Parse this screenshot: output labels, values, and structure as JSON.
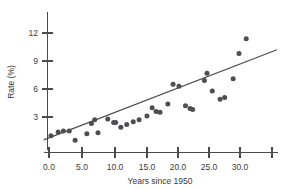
{
  "chart_data": {
    "type": "scatter",
    "title": "",
    "xlabel": "Years since 1950",
    "ylabel": "Rate (%)",
    "xlim": [
      -1.0,
      35.5
    ],
    "ylim": [
      0.0,
      13.0
    ],
    "grid": false,
    "legend": null,
    "x_ticks": [
      0.0,
      5.0,
      10.0,
      15.0,
      20.0,
      25.0,
      30.0,
      35.0
    ],
    "x_tick_labels": [
      "0.0",
      "5.0",
      "10.0",
      "15.0",
      "20.0",
      "25.0",
      "30.0",
      ""
    ],
    "y_ticks": [
      3,
      6,
      9,
      12
    ],
    "y_tick_labels": [
      "3",
      "6",
      "9",
      "12"
    ],
    "point_color": "#4d4d52",
    "line_color": "#4a4a4a",
    "axis_color": "#4a4a4a",
    "points": [
      {
        "x": 0.3,
        "y": 1.0
      },
      {
        "x": 1.4,
        "y": 1.4
      },
      {
        "x": 2.2,
        "y": 1.5
      },
      {
        "x": 3.1,
        "y": 1.5
      },
      {
        "x": 4.0,
        "y": 0.5
      },
      {
        "x": 5.8,
        "y": 1.2
      },
      {
        "x": 6.5,
        "y": 2.3
      },
      {
        "x": 7.0,
        "y": 2.7
      },
      {
        "x": 7.5,
        "y": 1.3
      },
      {
        "x": 9.0,
        "y": 2.8
      },
      {
        "x": 9.9,
        "y": 2.4
      },
      {
        "x": 10.2,
        "y": 2.4
      },
      {
        "x": 11.0,
        "y": 1.9
      },
      {
        "x": 11.9,
        "y": 2.2
      },
      {
        "x": 12.9,
        "y": 2.5
      },
      {
        "x": 13.8,
        "y": 2.7
      },
      {
        "x": 15.0,
        "y": 3.1
      },
      {
        "x": 15.8,
        "y": 4.0
      },
      {
        "x": 16.4,
        "y": 3.6
      },
      {
        "x": 17.0,
        "y": 3.5
      },
      {
        "x": 18.2,
        "y": 4.4
      },
      {
        "x": 19.0,
        "y": 6.5
      },
      {
        "x": 19.9,
        "y": 6.3
      },
      {
        "x": 20.9,
        "y": 4.2
      },
      {
        "x": 21.6,
        "y": 3.9
      },
      {
        "x": 22.0,
        "y": 3.8
      },
      {
        "x": 23.8,
        "y": 6.9
      },
      {
        "x": 24.2,
        "y": 7.7
      },
      {
        "x": 25.0,
        "y": 5.8
      },
      {
        "x": 26.2,
        "y": 4.9
      },
      {
        "x": 26.9,
        "y": 5.1
      },
      {
        "x": 28.2,
        "y": 7.1
      },
      {
        "x": 29.1,
        "y": 9.8
      },
      {
        "x": 30.2,
        "y": 11.4
      }
    ],
    "fit_line": {
      "name": "least-squares regression line",
      "x_start": -0.8,
      "y_start": 0.55,
      "x_end": 34.9,
      "y_end": 10.2
    }
  }
}
